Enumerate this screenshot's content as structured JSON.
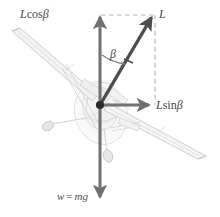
{
  "figure": {
    "type": "free-body-diagram",
    "background_color": "#ffffff",
    "vector_color": "#707070",
    "lift_vector_color": "#4d4d4d",
    "dashed_color": "#b0b0b0",
    "aircraft_color": "#c4c4c4",
    "label_color": "#4a4a4a"
  },
  "labels": {
    "lift_vertical": {
      "symbol": "L",
      "func": "cos",
      "angle": "β",
      "text": "Lcosβ"
    },
    "lift": {
      "text": "L"
    },
    "angle": {
      "text": "β"
    },
    "lift_horizontal": {
      "symbol": "L",
      "func": "sin",
      "angle": "β",
      "text": "Lsinβ"
    },
    "weight": {
      "lhs": "w",
      "eq": "=",
      "rhs": "mg",
      "text": "w = mg"
    }
  },
  "geometry": {
    "origin": {
      "x": 100,
      "y": 105
    },
    "lift_tip": {
      "x": 154,
      "y": 14
    },
    "vertical_tip": {
      "x": 100,
      "y": 14
    },
    "horizontal_tip": {
      "x": 152,
      "y": 105
    },
    "weight_tip": {
      "x": 100,
      "y": 200
    },
    "bank_angle_deg": 31
  },
  "aircraft": {
    "name": "light-single-engine-aircraft",
    "left_wing_tip": {
      "x": 12,
      "y": 31
    },
    "right_wing_tip": {
      "x": 206,
      "y": 156
    }
  }
}
